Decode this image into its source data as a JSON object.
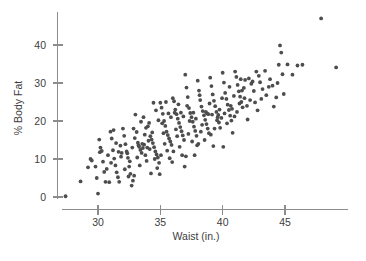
{
  "chart_data": {
    "type": "scatter",
    "title": "",
    "subtitle": "",
    "xlabel": "Waist (in.)",
    "ylabel": "% Body Fat",
    "xlim": [
      27.0,
      49.5
    ],
    "ylim": [
      -1.0,
      48.0
    ],
    "xticks": [
      30,
      35,
      40,
      45
    ],
    "yticks": [
      0,
      10,
      20,
      30,
      40
    ],
    "xtick_labels": [
      "30",
      "35",
      "40",
      "45"
    ],
    "ytick_labels": [
      "0",
      "10",
      "20",
      "30",
      "40"
    ],
    "grid": false,
    "legend": null,
    "legend_position": "none",
    "marker": {
      "shape": "circle",
      "color": "#4d4d4d",
      "radius_px": 1.9
    },
    "axis_color": "#8c8c8c",
    "background": "#ffffff",
    "n_points": 250,
    "series": [
      {
        "name": "Body fat vs waist",
        "points": [
          [
            27.4,
            0.2
          ],
          [
            28.6,
            4.1
          ],
          [
            29.4,
            10.0
          ],
          [
            29.5,
            9.6
          ],
          [
            29.8,
            8.0
          ],
          [
            29.9,
            5.0
          ],
          [
            30.0,
            0.9
          ],
          [
            30.1,
            15.1
          ],
          [
            30.2,
            13.0
          ],
          [
            30.4,
            9.3
          ],
          [
            30.5,
            6.6
          ],
          [
            30.6,
            4.0
          ],
          [
            30.8,
            11.0
          ],
          [
            31.0,
            17.2
          ],
          [
            31.1,
            15.4
          ],
          [
            31.2,
            12.3
          ],
          [
            31.3,
            10.1
          ],
          [
            31.4,
            8.3
          ],
          [
            31.5,
            6.5
          ],
          [
            31.6,
            5.2
          ],
          [
            31.7,
            4.0
          ],
          [
            31.8,
            13.5
          ],
          [
            31.9,
            11.6
          ],
          [
            32.0,
            18.0
          ],
          [
            32.1,
            16.1
          ],
          [
            32.2,
            13.9
          ],
          [
            32.3,
            12.0
          ],
          [
            32.4,
            10.3
          ],
          [
            32.5,
            8.0
          ],
          [
            32.6,
            6.1
          ],
          [
            32.7,
            3.0
          ],
          [
            32.8,
            4.3
          ],
          [
            32.9,
            5.6
          ],
          [
            33.0,
            21.7
          ],
          [
            33.1,
            17.1
          ],
          [
            33.2,
            14.3
          ],
          [
            33.3,
            13.2
          ],
          [
            33.4,
            12.4
          ],
          [
            33.5,
            11.6
          ],
          [
            33.6,
            12.9
          ],
          [
            33.7,
            13.8
          ],
          [
            33.8,
            11.0
          ],
          [
            33.9,
            9.5
          ],
          [
            34.0,
            18.6
          ],
          [
            34.1,
            19.5
          ],
          [
            34.2,
            16.0
          ],
          [
            34.3,
            15.1
          ],
          [
            34.4,
            14.2
          ],
          [
            34.5,
            13.1
          ],
          [
            34.6,
            12.0
          ],
          [
            34.7,
            11.2
          ],
          [
            34.8,
            10.4
          ],
          [
            34.9,
            9.0
          ],
          [
            35.0,
            24.8
          ],
          [
            35.1,
            23.5
          ],
          [
            35.2,
            21.9
          ],
          [
            35.3,
            20.0
          ],
          [
            35.4,
            18.7
          ],
          [
            35.5,
            17.2
          ],
          [
            35.6,
            16.3
          ],
          [
            35.7,
            15.4
          ],
          [
            35.8,
            14.6
          ],
          [
            35.9,
            13.7
          ],
          [
            36.0,
            26.0
          ],
          [
            36.1,
            25.2
          ],
          [
            36.2,
            23.0
          ],
          [
            36.3,
            21.8
          ],
          [
            36.4,
            20.6
          ],
          [
            36.5,
            19.5
          ],
          [
            36.6,
            18.4
          ],
          [
            36.7,
            17.3
          ],
          [
            36.8,
            16.2
          ],
          [
            36.9,
            15.0
          ],
          [
            37.0,
            32.2
          ],
          [
            37.1,
            28.8
          ],
          [
            37.2,
            26.3
          ],
          [
            37.3,
            23.4
          ],
          [
            37.4,
            22.1
          ],
          [
            37.5,
            21.0
          ],
          [
            37.6,
            19.8
          ],
          [
            37.7,
            18.5
          ],
          [
            37.8,
            17.4
          ],
          [
            37.9,
            16.1
          ],
          [
            38.0,
            30.6
          ],
          [
            38.1,
            28.0
          ],
          [
            38.2,
            25.5
          ],
          [
            38.3,
            23.8
          ],
          [
            38.4,
            22.6
          ],
          [
            38.5,
            21.5
          ],
          [
            38.6,
            20.3
          ],
          [
            38.7,
            19.2
          ],
          [
            38.8,
            18.0
          ],
          [
            38.9,
            16.8
          ],
          [
            39.0,
            31.4
          ],
          [
            39.1,
            29.2
          ],
          [
            39.2,
            27.0
          ],
          [
            39.3,
            25.3
          ],
          [
            39.4,
            23.9
          ],
          [
            39.5,
            22.4
          ],
          [
            39.6,
            21.0
          ],
          [
            39.7,
            19.6
          ],
          [
            39.8,
            18.2
          ],
          [
            39.9,
            20.8
          ],
          [
            40.0,
            32.7
          ],
          [
            40.1,
            30.1
          ],
          [
            40.2,
            27.4
          ],
          [
            40.3,
            25.8
          ],
          [
            40.4,
            24.3
          ],
          [
            40.5,
            22.9
          ],
          [
            40.6,
            21.4
          ],
          [
            40.7,
            20.1
          ],
          [
            40.8,
            16.9
          ],
          [
            40.9,
            26.6
          ],
          [
            41.0,
            33.0
          ],
          [
            41.1,
            31.6
          ],
          [
            41.2,
            29.5
          ],
          [
            41.3,
            27.8
          ],
          [
            41.4,
            26.4
          ],
          [
            41.5,
            25.0
          ],
          [
            41.6,
            23.6
          ],
          [
            41.7,
            28.7
          ],
          [
            41.8,
            30.8
          ],
          [
            42.0,
            20.4
          ],
          [
            42.1,
            31.2
          ],
          [
            42.3,
            29.8
          ],
          [
            42.5,
            27.9
          ],
          [
            42.7,
            33.0
          ],
          [
            43.0,
            30.2
          ],
          [
            43.2,
            28.4
          ],
          [
            43.5,
            26.8
          ],
          [
            43.8,
            31.0
          ],
          [
            44.0,
            29.3
          ],
          [
            44.3,
            26.2
          ],
          [
            44.5,
            34.8
          ],
          [
            44.6,
            39.9
          ],
          [
            44.7,
            38.0
          ],
          [
            44.8,
            32.3
          ],
          [
            44.9,
            27.1
          ],
          [
            45.2,
            34.9
          ],
          [
            45.6,
            32.2
          ],
          [
            46.0,
            34.6
          ],
          [
            46.4,
            34.8
          ],
          [
            47.9,
            47.0
          ],
          [
            49.1,
            34.1
          ],
          [
            30.3,
            12.1
          ],
          [
            30.7,
            7.4
          ],
          [
            31.05,
            9.0
          ],
          [
            31.45,
            14.2
          ],
          [
            31.85,
            10.6
          ],
          [
            32.15,
            7.3
          ],
          [
            32.35,
            11.5
          ],
          [
            32.55,
            9.4
          ],
          [
            32.75,
            13.0
          ],
          [
            32.95,
            15.5
          ],
          [
            33.15,
            10.4
          ],
          [
            33.35,
            8.3
          ],
          [
            33.55,
            14.0
          ],
          [
            33.75,
            16.4
          ],
          [
            33.95,
            13.0
          ],
          [
            34.15,
            12.6
          ],
          [
            34.35,
            17.0
          ],
          [
            34.55,
            10.0
          ],
          [
            34.75,
            7.6
          ],
          [
            34.95,
            6.0
          ],
          [
            35.15,
            19.4
          ],
          [
            35.35,
            14.0
          ],
          [
            35.55,
            12.2
          ],
          [
            35.75,
            10.2
          ],
          [
            35.95,
            9.2
          ],
          [
            36.15,
            22.2
          ],
          [
            36.35,
            16.0
          ],
          [
            36.55,
            13.2
          ],
          [
            36.75,
            11.0
          ],
          [
            36.95,
            8.0
          ],
          [
            37.15,
            24.0
          ],
          [
            37.35,
            20.0
          ],
          [
            37.55,
            14.6
          ],
          [
            37.75,
            11.0
          ],
          [
            37.95,
            13.6
          ],
          [
            38.15,
            26.8
          ],
          [
            38.35,
            19.0
          ],
          [
            38.55,
            15.0
          ],
          [
            38.75,
            22.0
          ],
          [
            38.95,
            24.6
          ],
          [
            39.15,
            21.7
          ],
          [
            39.35,
            18.0
          ],
          [
            39.55,
            20.2
          ],
          [
            39.75,
            23.0
          ],
          [
            39.95,
            26.0
          ],
          [
            40.15,
            22.0
          ],
          [
            40.35,
            19.4
          ],
          [
            40.55,
            29.0
          ],
          [
            40.75,
            23.2
          ],
          [
            40.95,
            21.2
          ],
          [
            41.15,
            22.4
          ],
          [
            41.35,
            24.6
          ],
          [
            41.55,
            28.0
          ],
          [
            41.75,
            26.0
          ],
          [
            41.95,
            24.0
          ],
          [
            42.2,
            25.5
          ],
          [
            42.4,
            30.4
          ],
          [
            42.6,
            24.9
          ],
          [
            42.9,
            31.9
          ],
          [
            43.4,
            33.2
          ],
          [
            43.7,
            29.0
          ],
          [
            44.1,
            23.8
          ],
          [
            44.4,
            30.0
          ],
          [
            30.9,
            3.9
          ],
          [
            31.25,
            17.6
          ],
          [
            33.45,
            19.8
          ],
          [
            34.05,
            14.8
          ],
          [
            34.85,
            20.2
          ],
          [
            35.85,
            21.0
          ],
          [
            36.85,
            21.2
          ],
          [
            37.85,
            20.6
          ],
          [
            38.85,
            21.8
          ],
          [
            35.45,
            25.0
          ],
          [
            36.45,
            24.4
          ],
          [
            34.65,
            22.8
          ],
          [
            33.85,
            18.2
          ],
          [
            32.85,
            18.0
          ],
          [
            35.05,
            11.0
          ],
          [
            36.05,
            12.0
          ],
          [
            37.05,
            10.7
          ],
          [
            38.05,
            14.0
          ],
          [
            39.05,
            16.4
          ],
          [
            34.45,
            24.8
          ],
          [
            33.25,
            13.6
          ],
          [
            32.45,
            5.4
          ],
          [
            31.65,
            11.9
          ],
          [
            30.15,
            11.8
          ],
          [
            29.2,
            7.8
          ],
          [
            35.25,
            16.8
          ],
          [
            36.25,
            17.8
          ],
          [
            37.25,
            16.6
          ],
          [
            38.25,
            17.2
          ],
          [
            39.25,
            13.4
          ],
          [
            40.05,
            13.2
          ],
          [
            34.25,
            6.2
          ],
          [
            33.65,
            21.0
          ],
          [
            35.65,
            22.0
          ],
          [
            36.65,
            22.2
          ],
          [
            37.65,
            22.2
          ],
          [
            38.65,
            22.4
          ],
          [
            39.65,
            21.6
          ],
          [
            40.65,
            24.0
          ],
          [
            41.45,
            31.0
          ],
          [
            42.8,
            22.8
          ],
          [
            43.1,
            25.8
          ]
        ]
      }
    ]
  },
  "axes": {
    "x_tick_labels": [
      "30",
      "35",
      "40",
      "45"
    ],
    "y_tick_labels": [
      "0",
      "10",
      "20",
      "30",
      "40"
    ],
    "x_title": "Waist (in.)",
    "y_title": "% Body Fat"
  }
}
